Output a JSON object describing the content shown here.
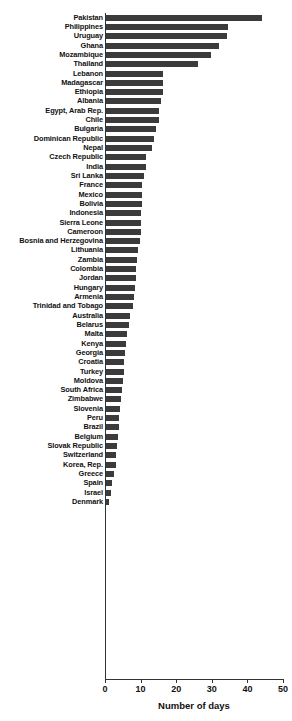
{
  "chart_data": {
    "type": "bar",
    "orientation": "horizontal",
    "title": "",
    "xlabel": "Number of days",
    "ylabel": "",
    "xlim": [
      0,
      50
    ],
    "xticks": [
      0,
      10,
      20,
      30,
      40,
      50
    ],
    "grid": false,
    "legend": null,
    "bar_color": "#3b3b3b",
    "axis_color": "#333333",
    "categories": [
      "Pakistan",
      "Philippines",
      "Uruguay",
      "Ghana",
      "Mozambique",
      "Thailand",
      "Lebanon",
      "Madagascar",
      "Ethiopia",
      "Albania",
      "Egypt, Arab Rep.",
      "Chile",
      "Bulgaria",
      "Dominican Republic",
      "Nepal",
      "Czech Republic",
      "India",
      "Sri Lanka",
      "France",
      "Mexico",
      "Bolivia",
      "Indonesia",
      "Sierra Leone",
      "Cameroon",
      "Bosnia and Herzegovina",
      "Lithuania",
      "Zambia",
      "Colombia",
      "Jordan",
      "Hungary",
      "Armenia",
      "Trinidad and Tobago",
      "Australia",
      "Belarus",
      "Malta",
      "Kenya",
      "Georgia",
      "Croatia",
      "Turkey",
      "Moldova",
      "South Africa",
      "Zimbabwe",
      "Slovenia",
      "Peru",
      "Brazil",
      "Belgium",
      "Slovak Republic",
      "Switzerland",
      "Korea, Rep.",
      "Greece",
      "Spain",
      "Israel",
      "Denmark"
    ],
    "values": [
      44.0,
      34.5,
      34.3,
      32.0,
      29.8,
      26.0,
      16.4,
      16.3,
      16.2,
      15.6,
      15.3,
      15.2,
      14.3,
      13.8,
      13.2,
      11.5,
      11.5,
      11.0,
      10.5,
      10.4,
      10.3,
      10.2,
      10.1,
      10.0,
      9.8,
      9.2,
      9.0,
      8.8,
      8.6,
      8.4,
      8.2,
      7.8,
      7.0,
      6.6,
      6.2,
      6.0,
      5.6,
      5.4,
      5.2,
      5.0,
      4.8,
      4.6,
      4.2,
      4.0,
      3.8,
      3.6,
      3.4,
      3.2,
      3.0,
      2.4,
      2.0,
      1.6,
      1.2
    ]
  },
  "axis": {
    "x_title": "Number of days",
    "tick_labels": [
      "0",
      "10",
      "20",
      "30",
      "40",
      "50"
    ]
  }
}
